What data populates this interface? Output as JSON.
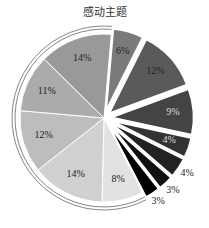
{
  "chart_data": {
    "type": "pie",
    "title": "感动主题",
    "labels_format": "percent",
    "slices": [
      {
        "value": 6,
        "label": "6%",
        "color": "#7a7a7a",
        "exploded": true,
        "label_color": "#222222"
      },
      {
        "value": 12,
        "label": "12%",
        "color": "#5a5a5a",
        "exploded": true,
        "label_color": "#222222"
      },
      {
        "value": 9,
        "label": "9%",
        "color": "#444444",
        "exploded": true,
        "label_color": "#dddddd"
      },
      {
        "value": 4,
        "label": "4%",
        "color": "#333333",
        "exploded": true,
        "label_color": "#dddddd"
      },
      {
        "value": 4,
        "label": "4%",
        "color": "#222222",
        "exploded": true,
        "label_color": "#222222",
        "label_outside": true
      },
      {
        "value": 3,
        "label": "3%",
        "color": "#111111",
        "exploded": true,
        "label_color": "#222222",
        "label_outside": true
      },
      {
        "value": 3,
        "label": "3%",
        "color": "#000000",
        "exploded": true,
        "label_color": "#222222",
        "label_outside": true
      },
      {
        "value": 8,
        "label": "8%",
        "color": "#e2e2e2",
        "exploded": false,
        "label_color": "#222222"
      },
      {
        "value": 14,
        "label": "14%",
        "color": "#d0d0d0",
        "exploded": false,
        "label_color": "#222222"
      },
      {
        "value": 12,
        "label": "12%",
        "color": "#bdbdbd",
        "exploded": false,
        "label_color": "#222222"
      },
      {
        "value": 11,
        "label": "11%",
        "color": "#ababab",
        "exploded": false,
        "label_color": "#222222"
      },
      {
        "value": 14,
        "label": "14%",
        "color": "#999999",
        "exploded": false,
        "label_color": "#222222"
      }
    ],
    "start_angle_deg": 5,
    "direction": "clockwise",
    "legend": "none"
  }
}
